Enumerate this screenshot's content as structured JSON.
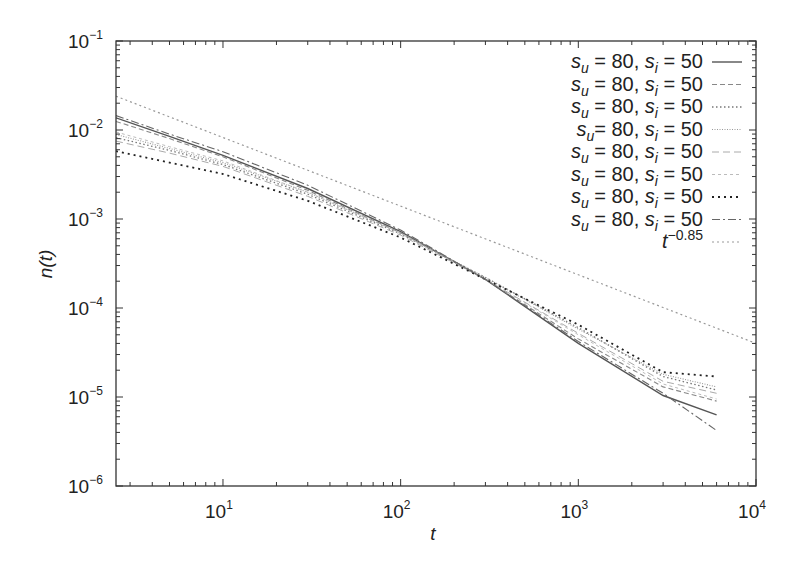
{
  "chart_data": {
    "type": "line",
    "title": "",
    "xlabel": "t",
    "ylabel": "n(t)",
    "xscale": "log",
    "yscale": "log",
    "xlim": [
      2.5,
      10000
    ],
    "ylim": [
      1e-06,
      0.1
    ],
    "grid": false,
    "legend_position": "upper right",
    "x_ticks": [
      {
        "value": 10,
        "base": "10",
        "exp": "1"
      },
      {
        "value": 100,
        "base": "10",
        "exp": "2"
      },
      {
        "value": 1000,
        "base": "10",
        "exp": "3"
      },
      {
        "value": 10000,
        "base": "10",
        "exp": "4"
      }
    ],
    "y_ticks": [
      {
        "value": 0.1,
        "base": "10",
        "exp": "−1"
      },
      {
        "value": 0.01,
        "base": "10",
        "exp": "−2"
      },
      {
        "value": 0.001,
        "base": "10",
        "exp": "−3"
      },
      {
        "value": 0.0001,
        "base": "10",
        "exp": "−4"
      },
      {
        "value": 1e-05,
        "base": "10",
        "exp": "−5"
      },
      {
        "value": 1e-06,
        "base": "10",
        "exp": "−6"
      }
    ],
    "series": [
      {
        "name": "s_u = 80, s_i = 50",
        "style": "solid",
        "color": "#555555",
        "x": [
          2.5,
          5,
          10,
          30,
          100,
          300,
          1000,
          3000,
          6000
        ],
        "values": [
          0.0137,
          0.0085,
          0.0052,
          0.0022,
          0.00072,
          0.00021,
          4e-05,
          1.04e-05,
          6.3e-06
        ]
      },
      {
        "name": "s_u = 80, s_i = 50",
        "style": "dashed",
        "color": "#888888",
        "x": [
          2.5,
          5,
          10,
          30,
          100,
          300,
          1000,
          3000,
          6000
        ],
        "values": [
          0.0125,
          0.008,
          0.005,
          0.0021,
          0.0007,
          0.00021,
          4.5e-05,
          1.3e-05,
          9e-06
        ]
      },
      {
        "name": "s_u = 80, s_i = 50",
        "style": "dotted",
        "color": "#777777",
        "x": [
          2.5,
          5,
          10,
          30,
          100,
          300,
          1000,
          3000,
          6000
        ],
        "values": [
          0.0082,
          0.0059,
          0.0041,
          0.0019,
          0.00068,
          0.00022,
          6e-05,
          1.7e-05,
          1.2e-05
        ]
      },
      {
        "name": "s_u = 80, s_i = 50",
        "style": "fine-dotted",
        "color": "#999999",
        "x": [
          2.5,
          5,
          10,
          30,
          100,
          300,
          1000,
          3000,
          6000
        ],
        "values": [
          0.0089,
          0.0062,
          0.0043,
          0.002,
          0.0007,
          0.00022,
          5.8e-05,
          1.8e-05,
          1.3e-05
        ]
      },
      {
        "name": "s_u = 80, s_i = 50",
        "style": "long-dash",
        "color": "#aaaaaa",
        "x": [
          2.5,
          5,
          10,
          30,
          100,
          300,
          1000,
          3000,
          6000
        ],
        "values": [
          0.0075,
          0.0055,
          0.0039,
          0.0018,
          0.00066,
          0.00021,
          5.2e-05,
          1.5e-05,
          1.1e-05
        ]
      },
      {
        "name": "s_u = 80, s_i = 50",
        "style": "dash-short",
        "color": "#bbbbbb",
        "x": [
          2.5,
          5,
          10,
          30,
          100,
          300,
          1000,
          3000,
          6000
        ],
        "values": [
          0.0095,
          0.0065,
          0.0045,
          0.002,
          0.00069,
          0.00021,
          5e-05,
          1.4e-05,
          9.5e-06
        ]
      },
      {
        "name": "s_u = 80, s_i = 50",
        "style": "dense-dot",
        "color": "#222222",
        "x": [
          2.5,
          5,
          10,
          30,
          100,
          300,
          1000,
          3000,
          6000
        ],
        "values": [
          0.0058,
          0.0043,
          0.0032,
          0.0016,
          0.00062,
          0.00021,
          6.5e-05,
          1.9e-05,
          1.7e-05
        ]
      },
      {
        "name": "s_u = 80, s_i = 50",
        "style": "dash-dot",
        "color": "#666666",
        "x": [
          2.5,
          5,
          10,
          30,
          100,
          300,
          1000,
          3000,
          6000
        ],
        "values": [
          0.0145,
          0.009,
          0.0057,
          0.0024,
          0.00075,
          0.00021,
          4.2e-05,
          1.1e-05,
          4.2e-06
        ]
      },
      {
        "name": "t^−0.85",
        "style": "ref-dotted",
        "color": "#999999",
        "x": [
          2.5,
          10000
        ],
        "values": [
          0.024,
          4e-05
        ]
      }
    ]
  },
  "legend": {
    "entries": [
      {
        "label_su": "s",
        "sub_u": "u",
        "mid": " = 80, ",
        "label_si": "s",
        "sub_i": "i",
        "end": " = 50"
      },
      {
        "label_su": "s",
        "sub_u": "u",
        "mid": " = 80, ",
        "label_si": "s",
        "sub_i": "i",
        "end": " = 50"
      },
      {
        "label_su": "s",
        "sub_u": "u",
        "mid": " = 80, ",
        "label_si": "s",
        "sub_i": "i",
        "end": " = 50"
      },
      {
        "label_su": "s",
        "sub_u": "u",
        "mid": "= 80, ",
        "label_si": "s",
        "sub_i": "i",
        "end": " = 50"
      },
      {
        "label_su": "s",
        "sub_u": "u",
        "mid": " = 80, ",
        "label_si": "s",
        "sub_i": "i",
        "end": " = 50"
      },
      {
        "label_su": "s",
        "sub_u": "u",
        "mid": " = 80, ",
        "label_si": "s",
        "sub_i": "i",
        "end": " = 50"
      },
      {
        "label_su": "s",
        "sub_u": "u",
        "mid": " = 80, ",
        "label_si": "s",
        "sub_i": "i",
        "end": " = 50"
      },
      {
        "label_su": "s",
        "sub_u": "u",
        "mid": " = 80, ",
        "label_si": "s",
        "sub_i": "i",
        "end": " = 50"
      }
    ],
    "ref_base": "t",
    "ref_exp": "−0.85"
  }
}
